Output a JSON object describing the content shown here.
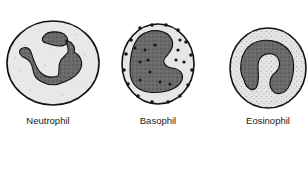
{
  "cells": [
    {
      "name": "Neutrophil",
      "cx": 53,
      "cy": 63,
      "label_x": 48
    },
    {
      "name": "Basophil",
      "cx": 158,
      "cy": 64,
      "label_x": 158
    },
    {
      "name": "Eosinophil",
      "cx": 268,
      "cy": 68,
      "label_x": 268
    }
  ],
  "colors": {
    "cytoplasm": "#e6e6e6",
    "outline": "#111111",
    "nucleus": "#6e6e6e",
    "granule_dark": "#1a1a1a",
    "granule_light": "#9a9a9a"
  }
}
